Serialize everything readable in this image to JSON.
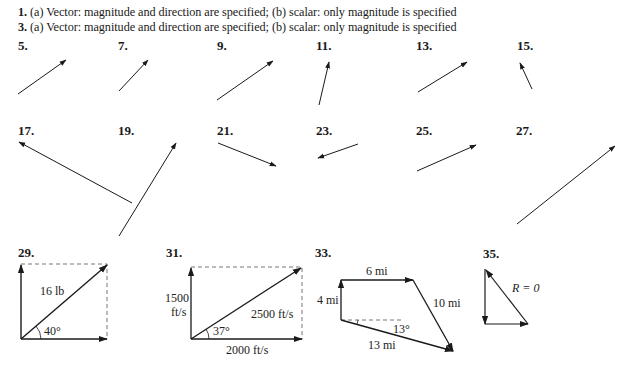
{
  "answers": [
    {
      "number": "1.",
      "text": "(a) Vector: magnitude and direction are specified; (b) scalar: only magnitude is specified"
    },
    {
      "number": "3.",
      "text": "(a) Vector: magnitude and direction are specified; (b) scalar: only magnitude is specified"
    }
  ],
  "figures": {
    "row1": [
      "5.",
      "7.",
      "9.",
      "11.",
      "13.",
      "15."
    ],
    "row2": [
      "17.",
      "19.",
      "21.",
      "23.",
      "25.",
      "27."
    ],
    "row3": [
      "29.",
      "31.",
      "33.",
      "35."
    ]
  },
  "fig29": {
    "resultant": "16 lb",
    "angle": "40°"
  },
  "fig31": {
    "vertical_a": "1500",
    "vertical_b": "ft/s",
    "resultant": "2500 ft/s",
    "horizontal": "2000 ft/s",
    "angle": "37°"
  },
  "fig33": {
    "top": "6 mi",
    "left": "4 mi",
    "right": "10 mi",
    "bottom": "13 mi",
    "angle": "13°"
  },
  "fig35": {
    "resultant": "R = 0"
  }
}
